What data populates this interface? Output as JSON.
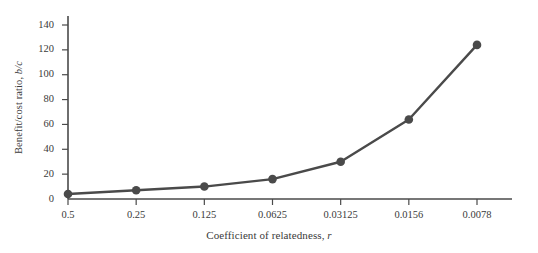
{
  "chart_data": {
    "type": "line",
    "title": "",
    "xlabel": "Coefficient of relatedness, r",
    "ylabel": "Benefit/cost ratio, b/c",
    "categories": [
      "0.5",
      "0.25",
      "0.125",
      "0.0625",
      "0.03125",
      "0.0156",
      "0.0078"
    ],
    "x_tick_labels": [
      "0.5",
      "0.25",
      "0.125",
      "0.0625",
      "0.03125",
      "0.0156",
      "0.0078"
    ],
    "values": [
      4,
      7,
      10,
      16,
      30,
      64,
      124
    ],
    "series": [
      {
        "name": "benefit/cost ratio",
        "values": [
          4,
          7,
          10,
          16,
          30,
          64,
          124
        ]
      }
    ],
    "y_tick_labels": [
      "0",
      "20",
      "40",
      "60",
      "80",
      "100",
      "120",
      "140"
    ],
    "y_ticks": [
      0,
      20,
      40,
      60,
      80,
      100,
      120,
      140
    ],
    "ylim": [
      0,
      150
    ],
    "grid": false,
    "legend": "none",
    "line_color": "#4a4a4a",
    "marker_color": "#4a4a4a",
    "axis_color": "#4a4a4a",
    "background_color": "#ffffff"
  },
  "axis_titles": {
    "y_prefix": "Benefit/cost ratio, ",
    "y_italic": "b/c",
    "x_prefix": "Coefficient of relatedness, ",
    "x_italic": "r"
  }
}
